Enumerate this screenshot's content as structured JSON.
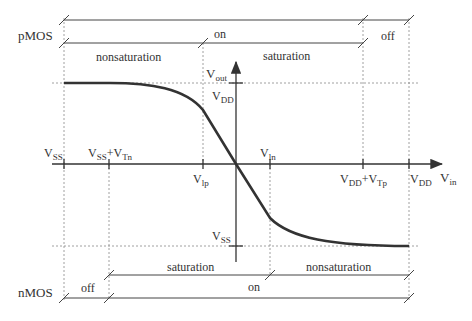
{
  "diagram": {
    "type": "CMOS inverter voltage transfer characteristic",
    "axes": {
      "x_label": "V",
      "x_label_sub": "in",
      "y_label": "V",
      "y_label_sub": "out"
    },
    "y_marks": {
      "vdd": {
        "main": "V",
        "sub": "DD"
      },
      "vss": {
        "main": "V",
        "sub": "SS"
      }
    },
    "x_marks": [
      {
        "id": "vss",
        "parts": [
          {
            "main": "V",
            "sub": "SS"
          }
        ],
        "position": "above"
      },
      {
        "id": "vss_vtn",
        "parts": [
          {
            "main": "V",
            "sub": "SS"
          },
          {
            "main": "+V",
            "sub": "Tn"
          }
        ],
        "position": "above"
      },
      {
        "id": "vlp",
        "parts": [
          {
            "main": "V",
            "sub": "lp"
          }
        ],
        "position": "below"
      },
      {
        "id": "vln",
        "parts": [
          {
            "main": "V",
            "sub": "ln"
          }
        ],
        "position": "above"
      },
      {
        "id": "vdd_vtp",
        "parts": [
          {
            "main": "V",
            "sub": "DD"
          },
          {
            "main": "+V",
            "sub": "Tp"
          }
        ],
        "position": "below"
      },
      {
        "id": "vdd",
        "parts": [
          {
            "main": "V",
            "sub": "DD"
          }
        ],
        "position": "below"
      }
    ],
    "pmos": {
      "label": "pMOS",
      "state_on": "on",
      "state_off": "off",
      "region_nonsat": "nonsaturation",
      "region_sat": "saturation"
    },
    "nmos": {
      "label": "nMOS",
      "state_on": "on",
      "state_off": "off",
      "region_sat": "saturation",
      "region_nonsat": "nonsaturation"
    },
    "colors": {
      "curve": "#333333",
      "lines": "#555555",
      "guides": "#888888"
    }
  }
}
